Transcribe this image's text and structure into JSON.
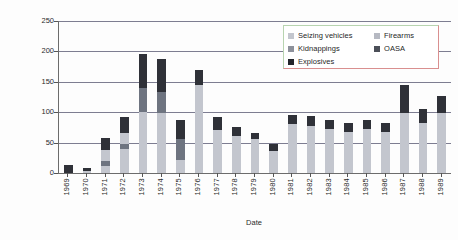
{
  "chart_data": {
    "type": "bar",
    "title": "",
    "xlabel": "Date",
    "ylabel": "Number of crimes",
    "ylim": [
      0,
      250
    ],
    "yticks": [
      0,
      50,
      100,
      150,
      200,
      250
    ],
    "grid": true,
    "stacked": true,
    "legend_position": "top-right",
    "categories": [
      "1969",
      "1970",
      "1971",
      "1972",
      "1973",
      "1974",
      "1975",
      "1976",
      "1977",
      "1978",
      "1979",
      "1980",
      "1981",
      "1982",
      "1983",
      "1984",
      "1985",
      "1986",
      "1987",
      "1988",
      "1989"
    ],
    "series": [
      {
        "name": "Seizing vehicles",
        "color": "#c3c6ce",
        "values": [
          0,
          4,
          12,
          40,
          100,
          98,
          22,
          120,
          62,
          55,
          48,
          32,
          68,
          68,
          62,
          60,
          62,
          60,
          78,
          65,
          78
        ]
      },
      {
        "name": "Kidnappings",
        "color": "#6e7480",
        "values": [
          0,
          0,
          8,
          8,
          40,
          36,
          34,
          0,
          0,
          0,
          0,
          0,
          0,
          0,
          0,
          0,
          0,
          0,
          0,
          0,
          0
        ]
      },
      {
        "name": "Firearms",
        "color": "#c3c6ce",
        "values": [
          0,
          0,
          18,
          18,
          0,
          0,
          0,
          25,
          8,
          6,
          8,
          4,
          12,
          10,
          10,
          8,
          10,
          8,
          20,
          18,
          20
        ]
      },
      {
        "name": "OASA",
        "color": "#5a5f6a",
        "values": [
          0,
          0,
          0,
          0,
          0,
          0,
          0,
          0,
          0,
          0,
          0,
          0,
          0,
          0,
          0,
          0,
          0,
          0,
          0,
          0,
          0
        ]
      },
      {
        "name": "Explosives",
        "color": "#2f3138",
        "values": [
          14,
          4,
          20,
          26,
          55,
          53,
          32,
          25,
          22,
          15,
          10,
          12,
          16,
          16,
          16,
          14,
          16,
          14,
          46,
          22,
          28
        ]
      }
    ],
    "totals": [
      14,
      8,
      58,
      92,
      195,
      187,
      88,
      170,
      92,
      76,
      66,
      48,
      96,
      94,
      88,
      82,
      88,
      82,
      144,
      105,
      126
    ],
    "legend_entries": [
      {
        "label": "Seizing vehicles",
        "color": "#c3c6ce"
      },
      {
        "label": "Firearms",
        "color": "#b6b9c2"
      },
      {
        "label": "Kidnappings",
        "color": "#8d919b"
      },
      {
        "label": "OASA",
        "color": "#4b4f58"
      },
      {
        "label": "Explosives",
        "color": "#23252b"
      }
    ]
  }
}
